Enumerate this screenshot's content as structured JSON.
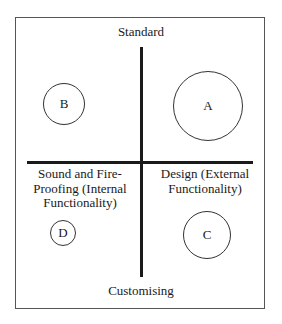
{
  "diagram": {
    "axes": {
      "top": "Standard",
      "bottom": "Customising"
    },
    "quadrants": {
      "bottom_left": {
        "label_lines": [
          "Sound and Fire-",
          "Proofing (Internal",
          "Functionality)"
        ]
      },
      "bottom_right": {
        "label_lines": [
          "Design (External",
          "Functionality)"
        ]
      }
    },
    "circles": [
      {
        "label": "A",
        "quadrant": "top-right",
        "cx": 208,
        "cy": 106,
        "r": 35
      },
      {
        "label": "B",
        "quadrant": "top-left",
        "cx": 64,
        "cy": 104,
        "r": 21
      },
      {
        "label": "C",
        "quadrant": "bottom-right",
        "cx": 207,
        "cy": 235,
        "r": 24
      },
      {
        "label": "D",
        "quadrant": "bottom-left",
        "cx": 63,
        "cy": 233,
        "r": 13
      }
    ],
    "colors": {
      "line": "#1a1a1a",
      "frame": "#555555",
      "background": "#ffffff"
    }
  }
}
